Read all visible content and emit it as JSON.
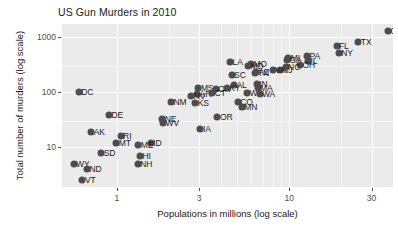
{
  "chart_data": {
    "type": "scatter",
    "title": "US Gun Murders in 2010",
    "xlabel": "Populations in millions (log scale)",
    "ylabel": "Total number of murders (log scale)",
    "xscale": "log",
    "yscale": "log",
    "xlim": [
      0.48,
      40
    ],
    "ylim": [
      1.9,
      1700
    ],
    "xticks": [
      1,
      3,
      10,
      30
    ],
    "xtick_labels": [
      "1",
      "3",
      "10",
      "30"
    ],
    "yticks": [
      10,
      100,
      1000
    ],
    "ytick_labels": [
      "10",
      "100",
      "1000"
    ],
    "grid": true,
    "legend": null,
    "point_color": "#4d4d4d",
    "panel_color": "#ebebeb",
    "grid_color": "#ffffff",
    "x_unit": "millions of people",
    "y_unit": "gun murders",
    "points": [
      {
        "label": "CA",
        "x": 37.25,
        "y": 1257
      },
      {
        "label": "TX",
        "x": 25.15,
        "y": 805
      },
      {
        "label": "FL",
        "x": 18.8,
        "y": 669
      },
      {
        "label": "NY",
        "x": 19.38,
        "y": 517
      },
      {
        "label": "PA",
        "x": 12.7,
        "y": 457
      },
      {
        "label": "MI",
        "x": 9.88,
        "y": 413
      },
      {
        "label": "IL",
        "x": 12.83,
        "y": 364
      },
      {
        "label": "GA",
        "x": 9.69,
        "y": 376
      },
      {
        "label": "OH",
        "x": 11.54,
        "y": 310
      },
      {
        "label": "NJ",
        "x": 8.79,
        "y": 246
      },
      {
        "label": "NC",
        "x": 9.53,
        "y": 286
      },
      {
        "label": "LA",
        "x": 4.53,
        "y": 351
      },
      {
        "label": "MO",
        "x": 5.99,
        "y": 321
      },
      {
        "label": "MD",
        "x": 5.77,
        "y": 293
      },
      {
        "label": "SC",
        "x": 4.63,
        "y": 207
      },
      {
        "label": "TN",
        "x": 6.35,
        "y": 219
      },
      {
        "label": "VA",
        "x": 8.0,
        "y": 250
      },
      {
        "label": "AZ",
        "x": 6.39,
        "y": 232
      },
      {
        "label": "AL",
        "x": 4.78,
        "y": 135
      },
      {
        "label": "IN",
        "x": 6.48,
        "y": 142
      },
      {
        "label": "MS",
        "x": 2.97,
        "y": 120
      },
      {
        "label": "OK",
        "x": 3.75,
        "y": 111
      },
      {
        "label": "KY",
        "x": 4.34,
        "y": 116
      },
      {
        "label": "AR",
        "x": 2.92,
        "y": 93
      },
      {
        "label": "WI",
        "x": 5.69,
        "y": 97
      },
      {
        "label": "WA",
        "x": 6.72,
        "y": 93
      },
      {
        "label": "CT",
        "x": 3.57,
        "y": 97
      },
      {
        "label": "MA",
        "x": 6.55,
        "y": 118
      },
      {
        "label": "NV",
        "x": 2.7,
        "y": 84
      },
      {
        "label": "CO",
        "x": 5.03,
        "y": 65
      },
      {
        "label": "MN",
        "x": 5.3,
        "y": 53
      },
      {
        "label": "NM",
        "x": 2.06,
        "y": 67
      },
      {
        "label": "KS",
        "x": 2.85,
        "y": 63
      },
      {
        "label": "OR",
        "x": 3.83,
        "y": 36
      },
      {
        "label": "IA",
        "x": 3.05,
        "y": 21
      },
      {
        "label": "NE",
        "x": 1.83,
        "y": 32
      },
      {
        "label": "WV",
        "x": 1.85,
        "y": 27
      },
      {
        "label": "DC",
        "x": 0.6,
        "y": 99
      },
      {
        "label": "DE",
        "x": 0.9,
        "y": 38
      },
      {
        "label": "AK",
        "x": 0.71,
        "y": 19
      },
      {
        "label": "RI",
        "x": 1.05,
        "y": 16
      },
      {
        "label": "MT",
        "x": 0.99,
        "y": 12
      },
      {
        "label": "ID",
        "x": 1.57,
        "y": 12
      },
      {
        "label": "ME",
        "x": 1.33,
        "y": 11
      },
      {
        "label": "SD",
        "x": 0.81,
        "y": 8
      },
      {
        "label": "HI",
        "x": 1.36,
        "y": 7
      },
      {
        "label": "NH",
        "x": 1.32,
        "y": 5
      },
      {
        "label": "WY",
        "x": 0.56,
        "y": 5
      },
      {
        "label": "ND",
        "x": 0.67,
        "y": 4
      },
      {
        "label": "VT",
        "x": 0.63,
        "y": 2.5
      }
    ],
    "x_minor_gridlines": [
      2,
      4,
      5,
      6,
      7,
      8,
      9,
      20
    ],
    "y_minor_gridlines": [
      30,
      300
    ]
  }
}
